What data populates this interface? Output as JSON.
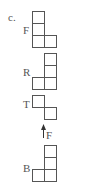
{
  "problem_label": "c.",
  "views": [
    {
      "label": "F",
      "name": "front-view"
    },
    {
      "label": "R",
      "name": "right-view"
    },
    {
      "label": "T",
      "name": "top-view"
    },
    {
      "label": "B",
      "name": "back-view"
    }
  ],
  "arrow": {
    "label": "F",
    "direction": "up"
  },
  "colors": {
    "stroke": "#555555",
    "background": "#ffffff"
  }
}
